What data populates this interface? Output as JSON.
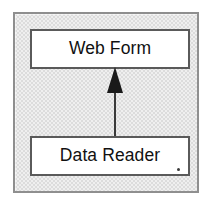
{
  "diagram": {
    "type": "uml-class-diagram",
    "frame": {
      "border_color": "#8f8f8f",
      "fill_color": "#dcdcdc"
    },
    "nodes": [
      {
        "id": "web-form",
        "label": "Web Form",
        "role": "parent",
        "fill_color": "#ffffff",
        "border_color": "#5a5a5a"
      },
      {
        "id": "data-reader",
        "label": "Data Reader",
        "role": "child",
        "fill_color": "#ffffff",
        "border_color": "#5a5a5a",
        "trailing_mark": "."
      }
    ],
    "connectors": [
      {
        "id": "generalization",
        "kind": "generalization-arrow",
        "from": "data-reader",
        "to": "web-form",
        "direction": "up",
        "head": "solid-filled-triangle",
        "line_color": "#3a3a3a"
      }
    ]
  }
}
